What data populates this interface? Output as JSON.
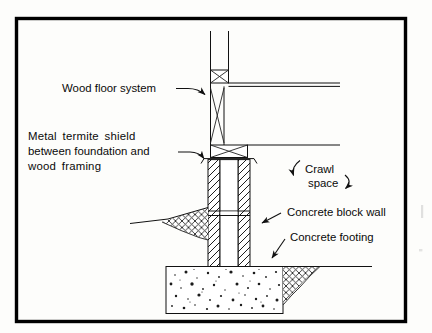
{
  "figure": {
    "type": "architectural-section-drawing",
    "background_color": "#fdfdfb",
    "ink_color": "#111111",
    "border_color": "#000000"
  },
  "labels": {
    "wood_floor_system": "Wood floor system",
    "termite_shield_line1": "Metal  termite  shield",
    "termite_shield_line2": "between foundation and",
    "termite_shield_line3": "wood  framing",
    "crawl_line1": "Crawl",
    "crawl_line2": "space",
    "concrete_block_wall": "Concrete block wall",
    "concrete_footing": "Concrete footing"
  },
  "components": {
    "wall_above": "framed wall above floor",
    "sill_plate_upper": "upper sill plate with x-bracing",
    "floor_joist": "wood floor joist with x-bracing",
    "sill_plate_lower": "lower sill plate with x-bracing",
    "termite_shield": "metal termite shield",
    "block_wall": "hollow concrete block wall, hatched",
    "mortar_joint": "block course mortar joint",
    "footing": "concrete footing with stipple fill",
    "grade_left": "earth grade line left with cross hatch",
    "grade_right": "earth grade line right with cross hatch"
  }
}
